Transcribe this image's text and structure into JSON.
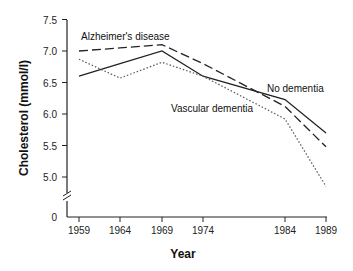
{
  "chart_data": {
    "type": "line",
    "title": "",
    "xlabel": "Year",
    "ylabel": "Cholesterol (mmol/l)",
    "x": [
      1959,
      1964,
      1969,
      1974,
      1984,
      1989
    ],
    "x_tick_labels": [
      "1959",
      "1964",
      "1969",
      "1974",
      "1984",
      "1989"
    ],
    "y_tick_labels": [
      "7.5",
      "7.0",
      "6.5",
      "6.0",
      "5.5",
      "5.0",
      "0"
    ],
    "ylim": [
      4.7,
      7.5
    ],
    "y_axis_break": true,
    "grid": false,
    "legend": "inline labels",
    "series": [
      {
        "name": "Alzheimer's disease",
        "style": "dashed",
        "values": [
          7.0,
          7.05,
          7.1,
          6.8,
          6.12,
          5.48
        ]
      },
      {
        "name": "No dementia",
        "style": "solid",
        "values": [
          6.6,
          6.8,
          7.0,
          6.6,
          6.23,
          5.7
        ]
      },
      {
        "name": "Vascular dementia",
        "style": "dotted",
        "values": [
          6.87,
          6.57,
          6.82,
          6.6,
          5.92,
          4.85
        ]
      }
    ]
  },
  "labels": {
    "alzheimers": "Alzheimer's disease",
    "no_dementia": "No dementia",
    "vascular": "Vascular dementia",
    "xlabel": "Year",
    "ylabel": "Cholesterol (mmol/l)"
  }
}
